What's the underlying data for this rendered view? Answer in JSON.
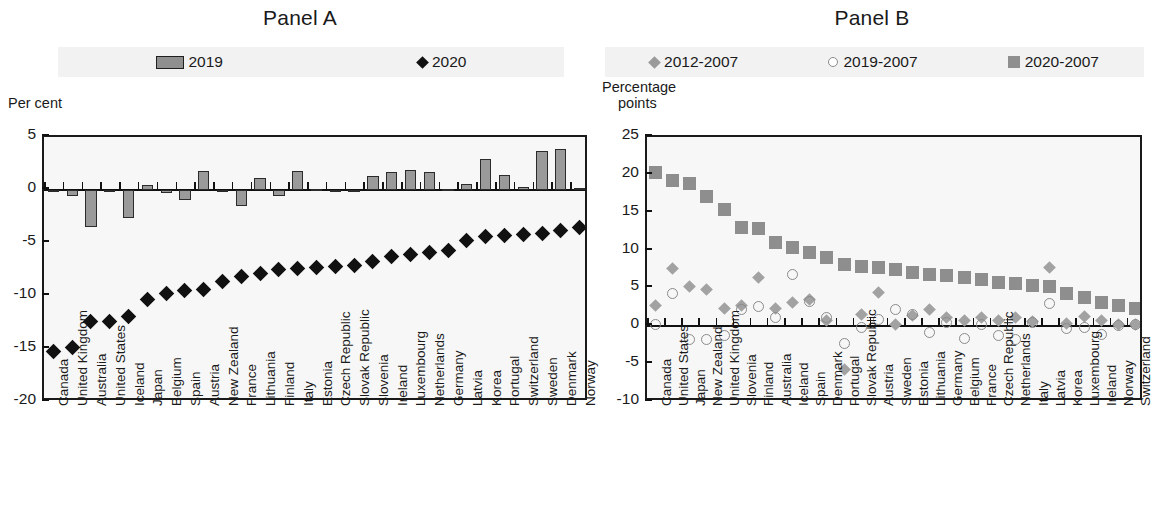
{
  "panel_a": {
    "title": "Panel A",
    "axis_caption": "Per cent",
    "legend": [
      {
        "label": "2019",
        "marker": "bar-swatch",
        "color": "#8f8f8f"
      },
      {
        "label": "2020",
        "marker": "diamond-black",
        "color": "#111111"
      }
    ]
  },
  "panel_b": {
    "title": "Panel B",
    "axis_caption_line1": "Percentage",
    "axis_caption_line2": "points",
    "legend": [
      {
        "label": "2012-2007",
        "marker": "diamond-gray",
        "color": "#9a9a9a"
      },
      {
        "label": "2019-2007",
        "marker": "circle-open",
        "color": "#8a8a8a"
      },
      {
        "label": "2020-2007",
        "marker": "square-gray",
        "color": "#8f8f8f"
      }
    ]
  },
  "chart_data": [
    {
      "type": "bar",
      "panel": "Panel A",
      "title": "Panel A",
      "xlabel": "",
      "ylabel": "Per cent",
      "ylim": [
        -20,
        5
      ],
      "yticks": [
        5,
        0,
        -5,
        -10,
        -15,
        -20
      ],
      "grid": false,
      "legend_position": "top",
      "categories": [
        "Canada",
        "United Kingdom",
        "Australia",
        "United States",
        "Iceland",
        "Japan",
        "Belgium",
        "Spain",
        "Austria",
        "New Zealand",
        "France",
        "Lithuania",
        "Finland",
        "Italy",
        "Estonia",
        "Czech Republic",
        "Slovak Republic",
        "Slovenia",
        "Ireland",
        "Luxembourg",
        "Netherlands",
        "Germany",
        "Latvia",
        "Korea",
        "Portugal",
        "Switzerland",
        "Sweden",
        "Denmark",
        "Norway"
      ],
      "series": [
        {
          "name": "2019",
          "type": "bar",
          "values": [
            -0.1,
            -0.6,
            -3.5,
            -0.2,
            -2.6,
            0.5,
            -0.3,
            -0.9,
            1.8,
            -0.2,
            -1.5,
            1.1,
            -0.6,
            1.8,
            0.1,
            -0.2,
            -0.1,
            1.3,
            1.7,
            1.9,
            1.7,
            0.1,
            0.6,
            2.9,
            1.4,
            0.3,
            3.7,
            3.9,
            0.2
          ]
        },
        {
          "name": "2020",
          "type": "scatter",
          "marker": "diamond",
          "values": [
            -15.2,
            -14.9,
            -12.4,
            -12.4,
            -11.9,
            -10.3,
            -9.8,
            -9.5,
            -9.4,
            -8.6,
            -8.2,
            -7.9,
            -7.5,
            -7.4,
            -7.3,
            -7.2,
            -7.1,
            -6.7,
            -6.3,
            -6.1,
            -5.9,
            -5.7,
            -4.8,
            -4.4,
            -4.3,
            -4.2,
            -4.1,
            -3.8,
            -3.5
          ]
        }
      ]
    },
    {
      "type": "scatter",
      "panel": "Panel B",
      "title": "Panel B",
      "xlabel": "",
      "ylabel": "Percentage points",
      "ylim": [
        -10,
        25
      ],
      "yticks": [
        25,
        20,
        15,
        10,
        5,
        0,
        -5,
        -10
      ],
      "grid": false,
      "legend_position": "top",
      "categories": [
        "Canada",
        "United States",
        "Japan",
        "New Zealand",
        "United Kingdom",
        "Slovenia",
        "Finland",
        "Australia",
        "Iceland",
        "Spain",
        "Denmark",
        "Portugal",
        "Slovak Republic",
        "Austria",
        "Sweden",
        "Estonia",
        "Lithuania",
        "Germany",
        "Belgium",
        "France",
        "Czech Republic",
        "Netherlands",
        "Italy",
        "Latvia",
        "Korea",
        "Luxembourg",
        "Ireland",
        "Norway",
        "Switzerland"
      ],
      "series": [
        {
          "name": "2012-2007",
          "marker": "diamond",
          "color": "#a2a2a2",
          "values": [
            2.8,
            7.6,
            5.3,
            4.8,
            2.4,
            2.7,
            6.5,
            2.3,
            3.2,
            3.5,
            0.7,
            -5.7,
            1.6,
            4.5,
            0.2,
            1.4,
            2.2,
            1.1,
            0.7,
            1.1,
            0.8,
            1.1,
            0.6,
            7.8,
            0.4,
            1.3,
            0.8,
            0.2,
            0.3
          ]
        },
        {
          "name": "2019-2007",
          "marker": "circle",
          "color": "#8a8a8a",
          "values": [
            0.3,
            4.3,
            -1.7,
            -1.8,
            -1.2,
            2.2,
            2.6,
            1.1,
            6.8,
            3.3,
            1.2,
            -2.3,
            -0.2,
            0.9,
            2.2,
            1.6,
            -0.8,
            0.5,
            -1.6,
            0.2,
            -1.2,
            -1.7,
            0.5,
            3.0,
            -0.3,
            -0.2,
            -1.1,
            0.1,
            0.2
          ]
        },
        {
          "name": "2020-2007",
          "marker": "square",
          "color": "#8e8e8e",
          "values": [
            20.3,
            19.3,
            18.8,
            17.1,
            15.4,
            13.0,
            12.9,
            11.1,
            10.4,
            9.8,
            9.1,
            8.2,
            7.9,
            7.8,
            7.5,
            7.1,
            6.9,
            6.7,
            6.4,
            6.2,
            5.8,
            5.6,
            5.4,
            5.3,
            4.3,
            3.8,
            3.1,
            2.7,
            2.4
          ]
        }
      ]
    }
  ]
}
